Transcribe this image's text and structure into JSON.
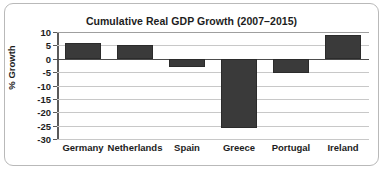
{
  "chart_data": {
    "type": "bar",
    "title": "Cumulative Real GDP Growth (2007–2015)",
    "xlabel": "",
    "ylabel": "% Growth",
    "categories": [
      "Germany",
      "Netherlands",
      "Spain",
      "Greece",
      "Portugal",
      "Ireland"
    ],
    "values": [
      6,
      5,
      -3,
      -26,
      -5.5,
      9
    ],
    "series": [
      {
        "name": "Cumulative Real GDP Growth",
        "values": [
          6,
          5,
          -3,
          -26,
          -5.5,
          9
        ]
      }
    ],
    "ylim": [
      -30,
      10
    ],
    "ytick_labels": [
      "10",
      "5",
      "0",
      "-5",
      "-10",
      "-15",
      "-20",
      "-25",
      "-30"
    ],
    "ytick_values": [
      10,
      5,
      0,
      -5,
      -10,
      -15,
      -20,
      -25,
      -30
    ],
    "grid": true,
    "legend": "none",
    "bar_color": "#3a3a3a",
    "gridline_color": "#c8c8c8",
    "zero_line_color": "#4d4d4d",
    "background_color": "#ffffff",
    "text_color": "#1d1d1d",
    "border_color": "#b9b9b9"
  }
}
